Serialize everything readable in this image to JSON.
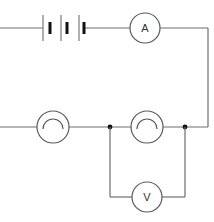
{
  "diagram": {
    "type": "circuit",
    "components": {
      "battery": {
        "cells": 3,
        "label": ""
      },
      "ammeter": {
        "symbol": "A"
      },
      "lamp_1": {
        "label": ""
      },
      "lamp_2": {
        "label": ""
      },
      "voltmeter": {
        "symbol": "V"
      }
    },
    "colors": {
      "wire": "#6e6e6e",
      "symbol_stroke": "#5a5a5a",
      "junction": "#111111",
      "background": "#ffffff"
    }
  }
}
